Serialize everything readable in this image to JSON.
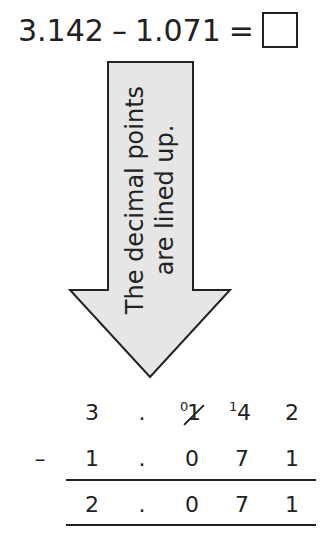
{
  "equation": {
    "left": "3.142",
    "operator": "–",
    "right": "1.071",
    "equals": "=",
    "answer": ""
  },
  "arrow": {
    "line1": "The decimal points",
    "line2": "are lined up.",
    "fill": "#e6e6e6",
    "stroke": "#222222"
  },
  "column_subtraction": {
    "operator": "–",
    "minuend": [
      "3",
      ".",
      "1",
      "4",
      "2"
    ],
    "subtrahend": [
      "1",
      ".",
      "0",
      "7",
      "1"
    ],
    "result": [
      "2",
      ".",
      "0",
      "7",
      "1"
    ],
    "regrouping": {
      "crossed_out_digit": "1",
      "new_value": "0",
      "carry_to_next": "1"
    }
  }
}
